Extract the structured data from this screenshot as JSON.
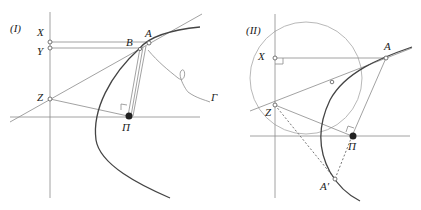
{
  "figures": [
    {
      "id": "I",
      "label": "(I)",
      "points": {
        "X": "X",
        "Y": "Y",
        "Z": "Z",
        "A": "A",
        "B": "B",
        "Pi": "Π",
        "Gamma": "Γ"
      }
    },
    {
      "id": "II",
      "label": "(II)",
      "points": {
        "X": "X",
        "Z": "Z",
        "A": "A",
        "Pi": "Π",
        "A_prime": "A′"
      }
    }
  ],
  "colors": {
    "construction_line": "#8a8a8a",
    "curve": "#444444",
    "circle": "#b0b0b0",
    "point": "#222222"
  }
}
